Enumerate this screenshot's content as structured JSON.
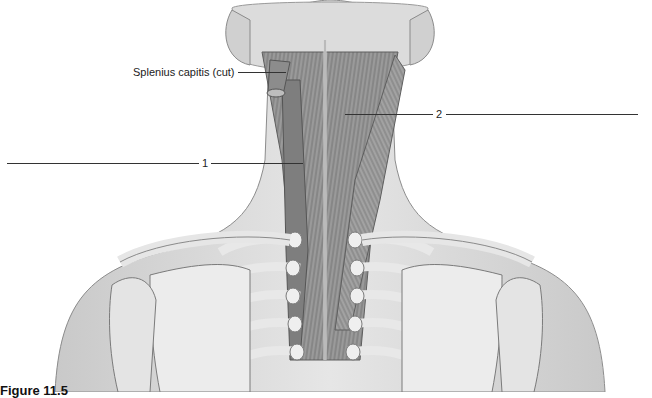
{
  "figure": {
    "caption_partial": "Figure 11.5",
    "labels": [
      {
        "id": "splenius",
        "text": "Splenius capitis (cut)"
      },
      {
        "id": "label1",
        "text": "1"
      },
      {
        "id": "label2",
        "text": "2"
      }
    ]
  },
  "colors": {
    "skin": "#d9d9d9",
    "muscle": "#8a8a8a",
    "bone": "#ededed",
    "outline": "#6f6f6f",
    "leader": "#333333"
  }
}
